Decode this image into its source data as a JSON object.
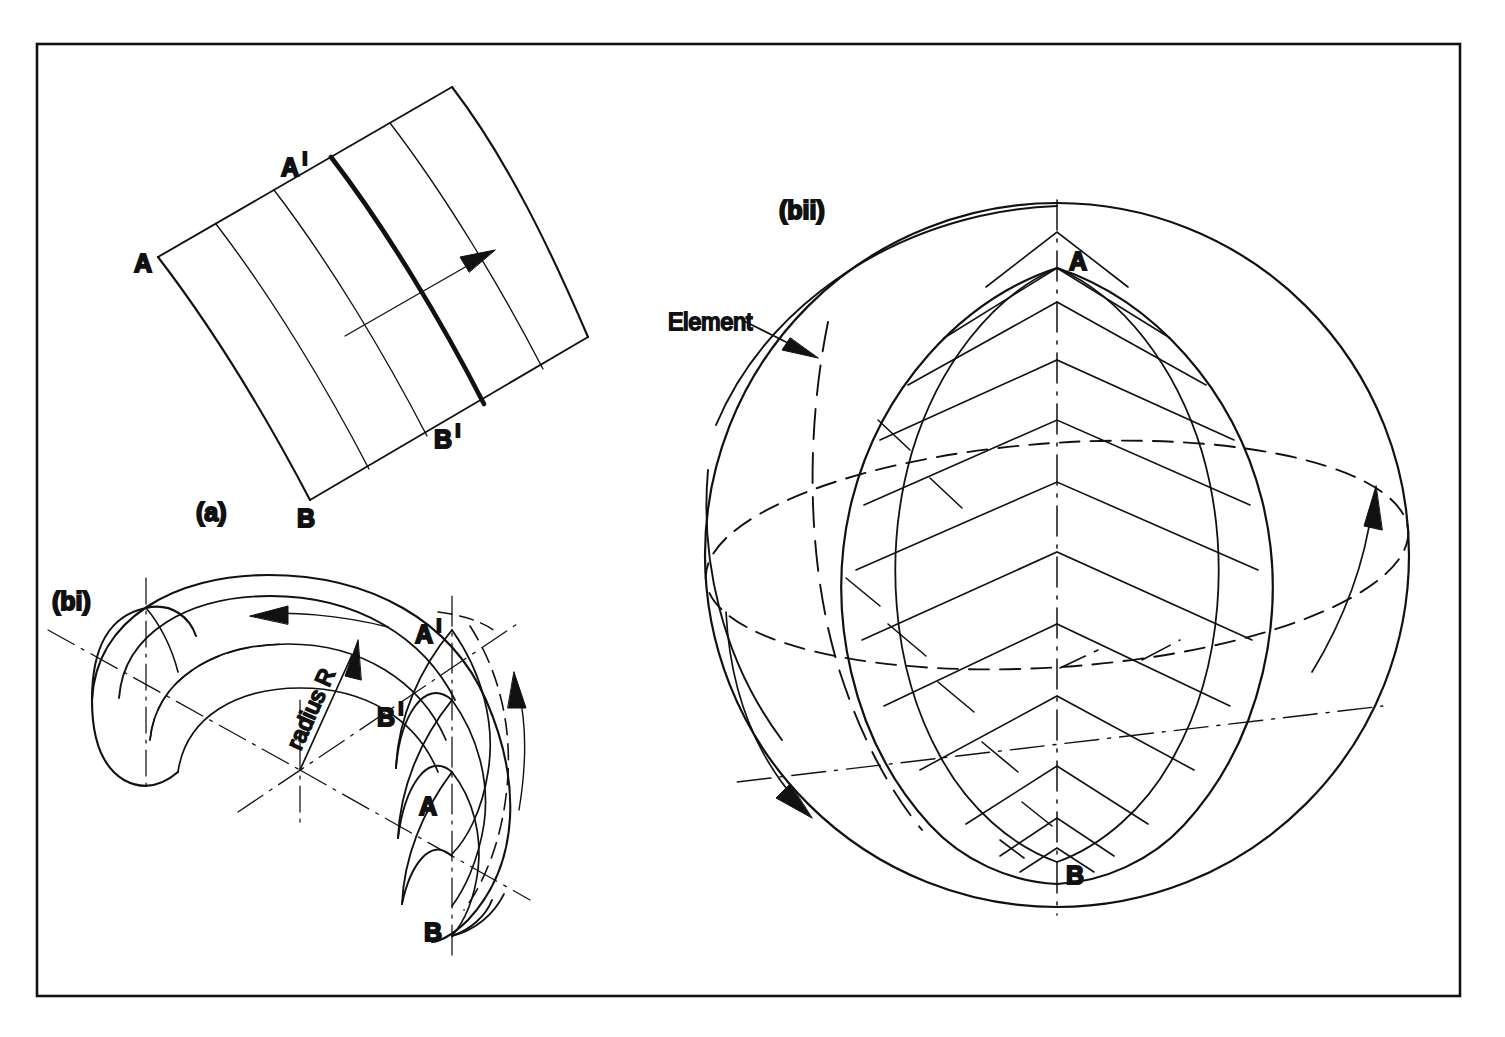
{
  "figure": {
    "type": "engineering-diagram",
    "background_color": "#ffffff",
    "line_color": "#111111",
    "frame": {
      "name": "outer-border",
      "x": 37,
      "y": 44,
      "width": 1423,
      "height": 952,
      "stroke": "#111111",
      "stroke_width": 2.6
    }
  },
  "panels": [
    {
      "id": "a",
      "caption": "(a)",
      "caption_pos": {
        "x": 196,
        "y": 520
      },
      "description": "Developable singly-curved sheet panel with straight generators; element A-A' to B-B' highlighted bold; arrow indicates direction of propagation",
      "labels": [
        {
          "name": "point-a",
          "text": "A",
          "x": 152,
          "y": 272
        },
        {
          "name": "point-a-prime",
          "text": "A",
          "prime": "I",
          "x": 288,
          "y": 175
        },
        {
          "name": "point-b",
          "text": "B",
          "x": 302,
          "y": 523
        },
        {
          "name": "point-b-prime",
          "text": "B",
          "prime": "I",
          "x": 440,
          "y": 445
        }
      ]
    },
    {
      "id": "bi",
      "caption": "(bi)",
      "caption_pos": {
        "x": 52,
        "y": 609
      },
      "description": "Toroidal / doubly-curved swept band generated by rotating arc of radius R about a vertical axis; centre-lines shown chain-dashed; curved arrows give sweep direction",
      "labels": [
        {
          "name": "radius-annotation",
          "text": "radius R",
          "x": 330,
          "y": 700,
          "rotation": -56
        },
        {
          "name": "point-a-prime",
          "text": "A",
          "prime": "I",
          "x": 421,
          "y": 640
        },
        {
          "name": "point-b-prime",
          "text": "B",
          "prime": "I",
          "x": 383,
          "y": 722
        },
        {
          "name": "point-a",
          "text": "A",
          "x": 425,
          "y": 810
        },
        {
          "name": "point-b",
          "text": "B",
          "x": 430,
          "y": 940
        }
      ]
    },
    {
      "id": "bii",
      "caption": "(bii)",
      "caption_pos": {
        "x": 779,
        "y": 218
      },
      "description": "Sphere formed by rotating a lune of chevron elements about the polar axis A-B; equator shown dashed; element indicated by leader arrow; curved arrows show rotation of generators",
      "labels": [
        {
          "name": "element-callout",
          "text": "Element",
          "x": 668,
          "y": 330
        },
        {
          "name": "point-a",
          "text": "A",
          "x": 1066,
          "y": 268
        },
        {
          "name": "point-b",
          "text": "B",
          "x": 1064,
          "y": 882
        }
      ]
    }
  ],
  "legend_text": {
    "a": "(a)",
    "bi": "(bi)",
    "bii": "(bii)",
    "element": "Element",
    "radius": "radius R",
    "A": "A",
    "B": "B",
    "prime": "I"
  },
  "geometry_notes": {
    "linetypes": [
      "solid",
      "dashed-hidden",
      "chain-dot-centreline",
      "bold-element"
    ],
    "bold_element_label": "A'-B' element",
    "panel_a_generators": 6,
    "bii_chevron_rows": 10
  }
}
